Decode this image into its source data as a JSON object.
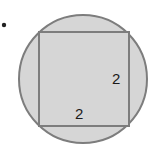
{
  "diagram": {
    "bullet": "•",
    "shapes": {
      "circle": {
        "cx": 83,
        "cy": 79,
        "r": 64,
        "fill": "#d6d6d6",
        "stroke": "#7d7d7d"
      },
      "square": {
        "x": 39,
        "y": 32,
        "width": 90,
        "height": 94,
        "fill": "#d6d6d6",
        "stroke": "#7d7d7d"
      }
    },
    "labels": {
      "right_side": "2",
      "bottom_side": "2"
    }
  }
}
